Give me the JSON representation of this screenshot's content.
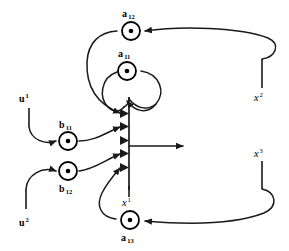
{
  "figure": {
    "type": "signal-flow-graph",
    "title": "",
    "background_color": "#ffffff",
    "line_color": "#1a1a1a",
    "width": 289,
    "height": 251
  },
  "nodes": [
    {
      "id": "a12",
      "label": "a",
      "subscript": "12",
      "label_full": "a12",
      "label_position": "above",
      "cx": 131,
      "cy": 31,
      "r": 9.5,
      "glyph": "gain-node"
    },
    {
      "id": "a11",
      "label": "a",
      "subscript": "11",
      "label_full": "a11",
      "label_position": "above",
      "cx": 127,
      "cy": 71,
      "r": 9.5,
      "glyph": "gain-node"
    },
    {
      "id": "b11",
      "label": "b",
      "subscript": "11",
      "label_full": "b11",
      "label_position": "above",
      "cx": 69,
      "cy": 140,
      "r": 9.5,
      "glyph": "gain-node"
    },
    {
      "id": "b12",
      "label": "b",
      "subscript": "12",
      "label_full": "b12",
      "label_position": "below",
      "cx": 69,
      "cy": 172,
      "r": 9.5,
      "glyph": "gain-node"
    },
    {
      "id": "a13",
      "label": "a",
      "subscript": "13",
      "label_full": "a13",
      "label_position": "below",
      "cx": 129,
      "cy": 221,
      "r": 9.5,
      "glyph": "gain-node"
    }
  ],
  "signals": [
    {
      "id": "u1",
      "base": "u",
      "superscript": "1",
      "label_full": "u1",
      "x": 22,
      "y": 102,
      "tick_x": 29,
      "tick_y1": 108,
      "tick_y2": 126,
      "description": "input signal one"
    },
    {
      "id": "u2",
      "base": "u",
      "superscript": "2",
      "label_full": "u2",
      "x": 22,
      "y": 224,
      "tick_x": 26,
      "tick_y1": 188,
      "tick_y2": 208,
      "description": "input signal two"
    },
    {
      "id": "x1",
      "base": "x",
      "superscript": "1",
      "label_full": "x1",
      "x": 124,
      "y": 204,
      "tick_x": 129,
      "tick_y1": 185,
      "tick_y2": 196,
      "description": "state one feedback tap"
    },
    {
      "id": "x2",
      "base": "x",
      "superscript": "2",
      "label_full": "x2",
      "x": 258,
      "y": 96,
      "tick_x": 262,
      "tick_y1": 60,
      "tick_y2": 86,
      "description": "state two feedback tap"
    },
    {
      "id": "x3",
      "base": "x",
      "superscript": "3",
      "label_full": "x3",
      "x": 258,
      "y": 154,
      "tick_x": 262,
      "tick_y1": 160,
      "tick_y2": 188,
      "description": "state three feedback tap"
    }
  ],
  "summing_junction": {
    "id": "sum-bar",
    "x": 129,
    "y_top": 97,
    "y_bottom": 190,
    "input_arrow_y": [
      113,
      126,
      140,
      153,
      167
    ],
    "output": {
      "from_x": 129,
      "to_x": 190,
      "y": 146
    }
  },
  "edges": [
    {
      "id": "u1-to-b11",
      "from": "u1",
      "to": "b11",
      "kind": "curve"
    },
    {
      "id": "b11-to-sum",
      "from": "b11",
      "to": "sum-bar",
      "kind": "curve"
    },
    {
      "id": "u2-to-b12",
      "from": "u2",
      "to": "b12",
      "kind": "curve"
    },
    {
      "id": "b12-to-sum",
      "from": "b12",
      "to": "sum-bar",
      "kind": "curve"
    },
    {
      "id": "x2-to-a12",
      "from": "x2",
      "to": "a12",
      "kind": "curve"
    },
    {
      "id": "a12-to-sum",
      "from": "a12",
      "to": "sum-bar",
      "kind": "curve"
    },
    {
      "id": "sum-to-a11-loop",
      "from": "sum-bar",
      "to": "a11",
      "kind": "self-loop"
    },
    {
      "id": "a11-to-sum",
      "from": "a11",
      "to": "sum-bar",
      "kind": "curve"
    },
    {
      "id": "x3-to-a13",
      "from": "x3",
      "to": "a13",
      "kind": "curve"
    },
    {
      "id": "a13-to-sum",
      "from": "a13",
      "to": "sum-bar",
      "kind": "curve"
    },
    {
      "id": "sum-output",
      "from": "sum-bar",
      "to": "x1",
      "kind": "straight"
    }
  ]
}
